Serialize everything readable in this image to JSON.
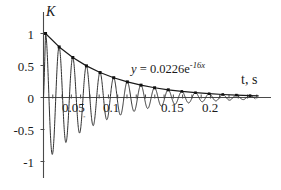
{
  "chart_data": {
    "type": "line",
    "title": "",
    "subtitle": "",
    "xlabel": "t, s",
    "ylabel": "K",
    "xlim": [
      -0.004,
      0.232
    ],
    "ylim": [
      -1.15,
      1.15
    ],
    "grid": false,
    "legend_position": "none",
    "annotations": [
      {
        "name": "fit-equation",
        "text_plain": "y = 0.0226e^-16x",
        "lhs": "y",
        "equals": " = ",
        "coefficient": "0.0226",
        "base": "e",
        "exponent": "-16x",
        "x": 0.096,
        "y": 0.46
      },
      {
        "name": "axis-artifact-asterisk",
        "text_plain": "*",
        "x": 0.0555,
        "y": -0.33
      }
    ],
    "xticks": [
      0.05,
      0.1,
      0.15,
      0.2
    ],
    "xticklabels": [
      "0.05",
      "0.1",
      "0.15",
      "0.2"
    ],
    "yticks": [
      1,
      0.5,
      0,
      -0.5,
      -1
    ],
    "yticklabels": [
      "1",
      "0.5",
      "0",
      "-0.5",
      "-1"
    ],
    "xminor_step": 0.01,
    "series": [
      {
        "name": "damped-oscillation",
        "type": "line",
        "color": "#303030",
        "description": "K(t) damped sinusoid, period 0.0147 s, decay rate 16 1/s",
        "amplitude0": 1.0,
        "decay_rate": 16,
        "period": 0.0147,
        "t_start": 0.0,
        "t_end": 0.2285
      },
      {
        "name": "exponential-envelope",
        "type": "line",
        "color": "#1a1a1a",
        "marker": "square",
        "description": "Fitted envelope through oscillation peaks",
        "coefficient_display": "0.0226",
        "decay_rate": 16,
        "peaks_t": [
          0.0022,
          0.0169,
          0.0316,
          0.0463,
          0.061,
          0.0757,
          0.0904,
          0.1051,
          0.1198,
          0.1345,
          0.1492,
          0.1639,
          0.1786,
          0.1933,
          0.208,
          0.2227
        ],
        "peaks_k": [
          1.0,
          0.79,
          0.625,
          0.494,
          0.39,
          0.309,
          0.244,
          0.193,
          0.152,
          0.12,
          0.095,
          0.075,
          0.059,
          0.047,
          0.037,
          0.029
        ]
      }
    ],
    "colors": {
      "curve": "#303030",
      "envelope": "#1a1a1a",
      "axis": "#3a3a3a",
      "background": "#ffffff",
      "text": "#1a1a1a"
    }
  }
}
